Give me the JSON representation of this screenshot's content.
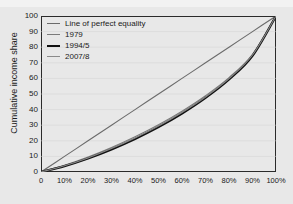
{
  "figure": {
    "clipped_header_text": "",
    "background_color": "#e8e8e8",
    "frame_color": "#2b2b2b"
  },
  "axes": {
    "ylabel": "Cumulative income share",
    "xlabel": "",
    "yticks": [
      "100",
      "90",
      "80",
      "70",
      "60",
      "50",
      "40",
      "30",
      "20",
      "10",
      "0"
    ],
    "xticks": [
      "0",
      "10%",
      "20%",
      "30%",
      "40%",
      "50%",
      "60%",
      "70%",
      "80%",
      "90%",
      "100%"
    ]
  },
  "legend": {
    "items": [
      {
        "label": "Line of perfect equality",
        "color": "#6b6b6b",
        "width": "1.1"
      },
      {
        "label": "1979",
        "color": "#7a7a7a",
        "width": "1.1"
      },
      {
        "label": "1994/5",
        "color": "#111111",
        "width": "2.2"
      },
      {
        "label": "2007/8",
        "color": "#8a8a8a",
        "width": "1.1"
      }
    ]
  },
  "chart_data": {
    "type": "line",
    "title": "",
    "xlabel": "",
    "ylabel": "Cumulative income share",
    "xlim": [
      0,
      100
    ],
    "ylim": [
      0,
      100
    ],
    "grid": "horizontal-faint",
    "legend_position": "upper-left-inside",
    "x": [
      0,
      10,
      20,
      30,
      40,
      50,
      60,
      70,
      80,
      90,
      100
    ],
    "series": [
      {
        "name": "Line of perfect equality",
        "color": "#6b6b6b",
        "width": "1.1",
        "values": [
          0,
          10,
          20,
          30,
          40,
          50,
          60,
          70,
          80,
          90,
          100
        ]
      },
      {
        "name": "1979",
        "color": "#7a7a7a",
        "width": "1.1",
        "values": [
          0,
          4.3,
          9.6,
          15.7,
          22.6,
          30.3,
          39.0,
          48.9,
          60.5,
          75.5,
          100
        ]
      },
      {
        "name": "1994/5",
        "color": "#111111",
        "width": "2.2",
        "values": [
          0,
          3.8,
          8.7,
          14.5,
          21.2,
          28.8,
          37.5,
          47.5,
          59.3,
          74.5,
          100
        ]
      },
      {
        "name": "2007/8",
        "color": "#8a8a8a",
        "width": "1.1",
        "values": [
          0,
          4.0,
          9.0,
          15.0,
          21.8,
          29.4,
          38.1,
          48.0,
          59.8,
          75.0,
          100
        ]
      }
    ]
  }
}
